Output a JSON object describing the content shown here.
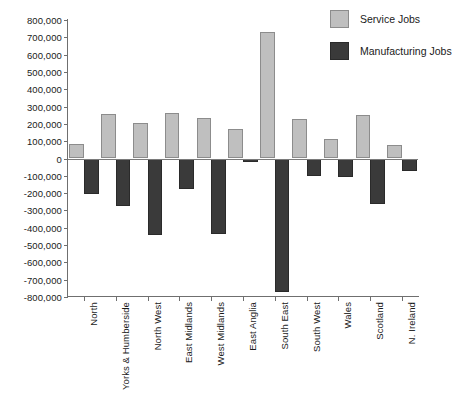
{
  "chart_data": {
    "type": "bar",
    "title": "",
    "xlabel": "",
    "ylabel": "",
    "ylim": [
      -800000,
      800000
    ],
    "ytick_step": 100000,
    "grid": false,
    "legend_position": "top-right",
    "categories": [
      "North",
      "Yorks & Humberside",
      "North West",
      "East Midlands",
      "West Midlands",
      "East Anglia",
      "South East",
      "South West",
      "Wales",
      "Scotland",
      "N. Ireland"
    ],
    "ytick_labels": [
      "800,000",
      "700,000",
      "600,000",
      "500,000",
      "400,000",
      "300,000",
      "200,000",
      "100,000",
      "0",
      "-100,000",
      "-200,000",
      "-300,000",
      "-400,000",
      "-500,000",
      "-600,000",
      "-700,000",
      "-800,000"
    ],
    "ytick_values": [
      800000,
      700000,
      600000,
      500000,
      400000,
      300000,
      200000,
      100000,
      0,
      -100000,
      -200000,
      -300000,
      -400000,
      -500000,
      -600000,
      -700000,
      -800000
    ],
    "series": [
      {
        "name": "Service Jobs",
        "color": "#bfbfbf",
        "values": [
          82000,
          259000,
          206000,
          265000,
          235000,
          170000,
          730000,
          230000,
          112000,
          253000,
          76000
        ]
      },
      {
        "name": "Manufacturing Jobs",
        "color": "#3a3a3a",
        "values": [
          -206000,
          -276000,
          -441000,
          -176000,
          -435000,
          -20000,
          -770000,
          -100000,
          -106000,
          -265000,
          -70000
        ]
      }
    ]
  },
  "legend": {
    "items": [
      {
        "label": "Service Jobs",
        "swatch": "service"
      },
      {
        "label": "Manufacturing Jobs",
        "swatch": "manufacturing"
      }
    ]
  }
}
